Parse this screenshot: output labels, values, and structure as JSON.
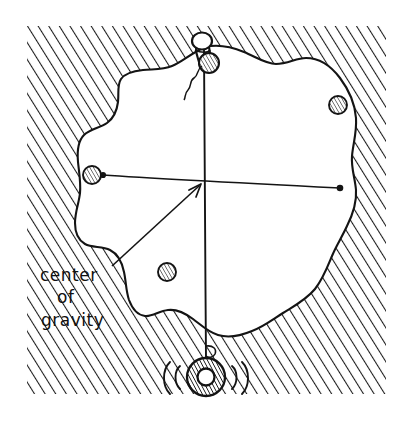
{
  "figure": {
    "kind": "hand-drawn physics diagram",
    "canvas": {
      "width": 412,
      "height": 427,
      "background": "#ffffff"
    },
    "ink_color": "#141414",
    "hatch_color": "#1a1a1a"
  },
  "annotations": {
    "label_lines": [
      "center",
      "of",
      "gravity"
    ],
    "label_line_1": "center",
    "label_line_2": "of",
    "label_line_3": "gravity",
    "leader_arrow_target": "intersection of plumb line and balance line"
  },
  "elements": {
    "background_hatch": "diagonal-hatch-background",
    "plate": "irregular flat plate outline",
    "pin": "push-pin suspension point",
    "knot": "string knot bead below pin",
    "loose_string_end": "free hanging string tail",
    "plumb_line": "vertical string from pin to bob",
    "plumb_bob": "hatched ring weight",
    "motion_arcs": "swing indication arcs",
    "balance_line": "horizontal line between two marked points",
    "holes": [
      "hole-upper-right",
      "hole-left",
      "hole-lower-center"
    ]
  },
  "geometry": {
    "pin_head": {
      "cx": 203,
      "cy": 42,
      "r": 9
    },
    "knot": {
      "cx": 208,
      "cy": 63,
      "r": 9
    },
    "plumb_top": {
      "x": 205,
      "y": 48
    },
    "plumb_bottom": {
      "x": 206,
      "y": 360
    },
    "bob": {
      "cx": 206,
      "cy": 377,
      "r_outer": 19,
      "r_inner": 9
    },
    "center_of_gravity": {
      "x": 203,
      "y": 183
    },
    "balance_left_dot": {
      "x": 103,
      "y": 175
    },
    "balance_right_dot": {
      "x": 340,
      "y": 188
    },
    "leader_start": {
      "x": 112,
      "y": 266
    },
    "leader_tip": {
      "x": 201,
      "y": 185
    },
    "hole_upper_right": {
      "cx": 338,
      "cy": 105,
      "r": 9
    },
    "hole_left": {
      "cx": 92,
      "cy": 175,
      "r": 9
    },
    "hole_lower_center": {
      "cx": 167,
      "cy": 272,
      "r": 9
    },
    "hatch_frame": {
      "x": 27,
      "y": 26,
      "width": 359,
      "height": 368
    },
    "label_anchor": {
      "x": 41,
      "y": 275
    }
  }
}
